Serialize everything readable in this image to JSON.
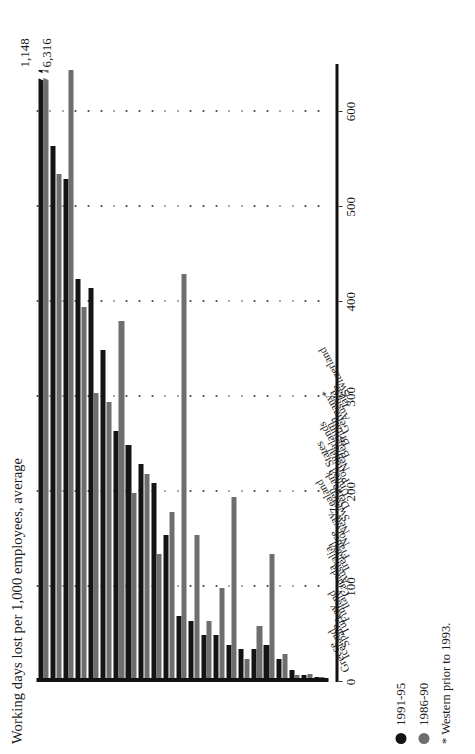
{
  "chart_data": {
    "type": "bar",
    "orientation": "vertical-columns-rotated",
    "title": "Working days lost per 1,000 employees, average",
    "xlabel": "",
    "ylabel": "",
    "ylim": [
      0,
      650
    ],
    "grid": true,
    "legend_position": "bottom-left",
    "tick_labels": [
      "0",
      "100",
      "200",
      "300",
      "400",
      "500",
      "600"
    ],
    "tick_values": [
      0,
      100,
      200,
      300,
      400,
      500,
      600
    ],
    "categories": [
      "Greece",
      "Iceland",
      "Spain",
      "Turkey",
      "Finland",
      "Italy",
      "Canada",
      "Australia",
      "Ireland",
      "France",
      "Norway",
      "New Zealand",
      "Sweden",
      "Denmark",
      "United States",
      "Portugal",
      "Netherlands",
      "Belgium",
      "Britain",
      "Germany*",
      "Austria",
      "Japan",
      "Switzerland"
    ],
    "series": [
      {
        "name": "1991-95",
        "color": "#141414",
        "values": [
          1148,
          560,
          525,
          420,
          410,
          345,
          260,
          245,
          225,
          205,
          150,
          65,
          60,
          45,
          45,
          35,
          30,
          30,
          35,
          20,
          8,
          3,
          1
        ]
      },
      {
        "name": "1986-90",
        "color": "#6e6e6e",
        "values": [
          6316,
          530,
          640,
          390,
          300,
          290,
          375,
          195,
          215,
          130,
          175,
          425,
          150,
          60,
          95,
          190,
          20,
          55,
          130,
          25,
          3,
          4,
          1
        ]
      }
    ],
    "annotations": [
      {
        "label": "1,148",
        "series": "1991-95",
        "category": "Greece",
        "note": "truncated bar"
      },
      {
        "label": "6,316",
        "series": "1986-90",
        "category": "Greece",
        "note": "truncated bar"
      }
    ],
    "clipped_category": "Greece",
    "clip_at": 640
  },
  "legend": {
    "items": [
      {
        "label": "1991-95",
        "color": "#141414"
      },
      {
        "label": "1986-90",
        "color": "#6e6e6e"
      }
    ]
  },
  "footnote": "* Western prior to 1993."
}
